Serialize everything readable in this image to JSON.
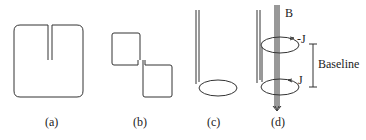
{
  "figure": {
    "panels": [
      {
        "id": "a",
        "label": "(a)",
        "description": "square gradiometer loop with slit"
      },
      {
        "id": "b",
        "label": "(b)",
        "description": "figure-eight planar gradiometer"
      },
      {
        "id": "c",
        "label": "(c)",
        "description": "single loop magnetometer with twisted leads"
      },
      {
        "id": "d",
        "label": "(d)",
        "description": "axial gradiometer with two opposing loops"
      }
    ],
    "annotations": {
      "field": "B",
      "current_top": "-J",
      "current_bottom": "J",
      "baseline": "Baseline"
    },
    "colors": {
      "line": "#333333",
      "background": "#ffffff"
    }
  }
}
